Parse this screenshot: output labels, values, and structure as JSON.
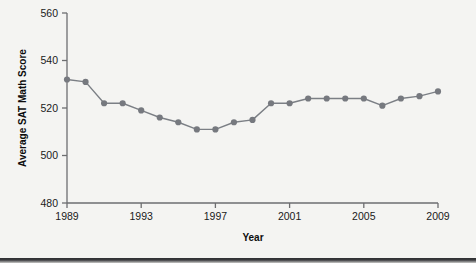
{
  "chart_data": {
    "type": "line",
    "title": "",
    "xlabel": "Year",
    "ylabel": "Average SAT Math Score",
    "xlim": [
      1989,
      2009
    ],
    "ylim": [
      480,
      560
    ],
    "xticks": [
      1989,
      1993,
      1997,
      2001,
      2005,
      2009
    ],
    "xticklabels": [
      "1989",
      "1993",
      "1997",
      "2001",
      "2005",
      "2009"
    ],
    "yticks": [
      480,
      500,
      520,
      540,
      560
    ],
    "yticklabels": [
      "480",
      "500",
      "520",
      "540",
      "560"
    ],
    "grid": false,
    "legend": "none",
    "marker": "circle",
    "line_color": "#7b7f85",
    "marker_color": "#76797f",
    "background_color": "#f4f4f2",
    "x": [
      1989,
      1990,
      1991,
      1992,
      1993,
      1994,
      1995,
      1996,
      1997,
      1998,
      1999,
      2000,
      2001,
      2002,
      2003,
      2004,
      2005,
      2006,
      2007,
      2008,
      2009
    ],
    "values": [
      532,
      531,
      522,
      522,
      519,
      516,
      514,
      511,
      511,
      514,
      515,
      522,
      522,
      524,
      524,
      524,
      524,
      521,
      524,
      525,
      527
    ],
    "series": [
      {
        "name": "Average SAT Math Score",
        "values": [
          532,
          531,
          522,
          522,
          519,
          516,
          514,
          511,
          511,
          514,
          515,
          522,
          522,
          524,
          524,
          524,
          524,
          521,
          524,
          525,
          527
        ]
      }
    ]
  },
  "axes": {
    "x_title": "Year",
    "y_title": "Average SAT Math Score"
  }
}
